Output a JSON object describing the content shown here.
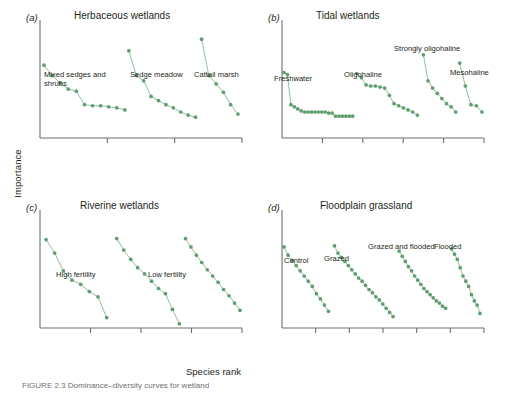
{
  "figure": {
    "ylabel": "Importance",
    "xlabel": "Species rank",
    "caption": "FIGURE 2.3 Dominance–diversity curves for wetland",
    "marker_color": "#5f9e6e",
    "line_color": "#7fb489",
    "axis_color": "#6d6e71"
  },
  "chart_data": {
    "type": "scatter",
    "xlabel": "Species rank",
    "ylabel": "Importance",
    "grid": false,
    "legend": "none",
    "axis_ticks_labeled": false,
    "note": "Four panels; each panel shows several rank–importance curves offset along the x axis. Values are relative positions read off the unlabeled axes (x = species rank within its offset block, y = importance, 0 at axis origin, 1 at top of plot area).",
    "panels": [
      {
        "tag": "(a)",
        "title": "Herbaceous wetlands",
        "xticks": 2,
        "series": [
          {
            "name": "Mixed sedges and shrubs",
            "label_lines": [
              "Mixed sedges and",
              "shrubs"
            ],
            "x": [
              1,
              2,
              3,
              4,
              5,
              6,
              7,
              8,
              9,
              10,
              11
            ],
            "y": [
              0.7,
              0.6,
              0.53,
              0.47,
              0.45,
              0.32,
              0.31,
              0.31,
              0.3,
              0.29,
              0.27
            ]
          },
          {
            "name": "Sedge meadow",
            "label_lines": [
              "Sedge meadow"
            ],
            "x": [
              1,
              2,
              3,
              4,
              5,
              6,
              7,
              8,
              9,
              10
            ],
            "y": [
              0.84,
              0.6,
              0.55,
              0.4,
              0.36,
              0.32,
              0.29,
              0.25,
              0.22,
              0.2
            ]
          },
          {
            "name": "Cattail marsh",
            "label_lines": [
              "Cattail marsh"
            ],
            "x": [
              1,
              2,
              3,
              4,
              5,
              6
            ],
            "y": [
              0.95,
              0.6,
              0.52,
              0.44,
              0.32,
              0.23
            ]
          }
        ]
      },
      {
        "tag": "(b)",
        "title": "Tidal wetlands",
        "xticks": 4,
        "series": [
          {
            "name": "Freshwater",
            "label_lines": [
              "Freshwater"
            ],
            "x": [
              1,
              2,
              3,
              4,
              5,
              6,
              7,
              8,
              9,
              10,
              11,
              12,
              13,
              14,
              15,
              16,
              17,
              18,
              19,
              20,
              21
            ],
            "y": [
              0.63,
              0.61,
              0.32,
              0.3,
              0.28,
              0.26,
              0.25,
              0.25,
              0.25,
              0.25,
              0.25,
              0.25,
              0.25,
              0.24,
              0.24,
              0.21,
              0.21,
              0.21,
              0.21,
              0.21,
              0.21
            ]
          },
          {
            "name": "Oligohaline",
            "label_lines": [
              "Oligohaline"
            ],
            "x": [
              1,
              2,
              3,
              4,
              5,
              6,
              7,
              8,
              9,
              10,
              11,
              12,
              13,
              14
            ],
            "y": [
              0.62,
              0.58,
              0.51,
              0.5,
              0.5,
              0.49,
              0.48,
              0.41,
              0.33,
              0.31,
              0.29,
              0.27,
              0.25,
              0.22
            ]
          },
          {
            "name": "Strongly oligohaline",
            "label_lines": [
              "Strongly oligohaline"
            ],
            "x": [
              1,
              2,
              3,
              4,
              5,
              6,
              7,
              8
            ],
            "y": [
              0.8,
              0.55,
              0.48,
              0.43,
              0.38,
              0.33,
              0.3,
              0.25
            ]
          },
          {
            "name": "Mesohaline",
            "label_lines": [
              "Mesohaline"
            ],
            "x": [
              1,
              2,
              3,
              4,
              5
            ],
            "y": [
              0.72,
              0.5,
              0.32,
              0.31,
              0.25
            ]
          }
        ]
      },
      {
        "tag": "(c)",
        "title": "Riverine wetlands",
        "xticks": 3,
        "series": [
          {
            "name": "High fertility",
            "label_lines": [
              "High fertility"
            ],
            "x": [
              1,
              2,
              3,
              4,
              5,
              6,
              7,
              8
            ],
            "y": [
              0.85,
              0.72,
              0.55,
              0.46,
              0.42,
              0.35,
              0.3,
              0.1
            ]
          },
          {
            "name": "(unlabelled middle curve)",
            "label_lines": [],
            "x": [
              1,
              2,
              3,
              4,
              5,
              6,
              7,
              8,
              9,
              10
            ],
            "y": [
              0.86,
              0.75,
              0.66,
              0.58,
              0.52,
              0.45,
              0.38,
              0.33,
              0.18,
              0.04
            ]
          },
          {
            "name": "Low fertility",
            "label_lines": [
              "Low fertility"
            ],
            "x": [
              1,
              2,
              3,
              4,
              5,
              6,
              7,
              8,
              9,
              10,
              11
            ],
            "y": [
              0.86,
              0.78,
              0.7,
              0.63,
              0.56,
              0.5,
              0.44,
              0.37,
              0.31,
              0.24,
              0.17
            ]
          }
        ]
      },
      {
        "tag": "(d)",
        "title": "Floodplain grassland",
        "xticks": 5,
        "series": [
          {
            "name": "Control",
            "label_lines": [
              "Control"
            ],
            "x": [
              1,
              2,
              3,
              4,
              5,
              6,
              7,
              8,
              9,
              10,
              11,
              12
            ],
            "y": [
              0.78,
              0.7,
              0.65,
              0.6,
              0.55,
              0.5,
              0.45,
              0.4,
              0.33,
              0.28,
              0.22,
              0.16
            ]
          },
          {
            "name": "Grazed",
            "label_lines": [
              "Grazed"
            ],
            "x": [
              1,
              2,
              3,
              4,
              5,
              6,
              7,
              8,
              9,
              10,
              11,
              12,
              13,
              14,
              15,
              16,
              17,
              18
            ],
            "y": [
              0.79,
              0.72,
              0.68,
              0.64,
              0.6,
              0.56,
              0.52,
              0.48,
              0.45,
              0.41,
              0.37,
              0.34,
              0.3,
              0.27,
              0.23,
              0.19,
              0.15,
              0.11
            ]
          },
          {
            "name": "Grazed and flooded",
            "label_lines": [
              "Grazed and flooded"
            ],
            "x": [
              1,
              2,
              3,
              4,
              5,
              6,
              7,
              8,
              9,
              10,
              11,
              12,
              13,
              14,
              15,
              16
            ],
            "y": [
              0.74,
              0.69,
              0.64,
              0.59,
              0.55,
              0.5,
              0.46,
              0.42,
              0.38,
              0.35,
              0.32,
              0.29,
              0.26,
              0.24,
              0.21,
              0.19
            ]
          },
          {
            "name": "Flooded",
            "label_lines": [
              "Flooded"
            ],
            "x": [
              1,
              2,
              3,
              4,
              5,
              6,
              7,
              8,
              9,
              10,
              11
            ],
            "y": [
              0.76,
              0.71,
              0.66,
              0.58,
              0.5,
              0.45,
              0.4,
              0.32,
              0.26,
              0.22,
              0.14
            ]
          }
        ]
      }
    ]
  }
}
